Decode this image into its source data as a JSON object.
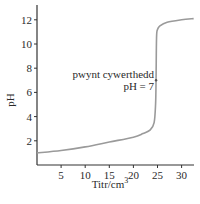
{
  "chart_data": {
    "type": "line",
    "title": "",
    "xlabel": "Titr/cm",
    "xlabel_superscript": "3",
    "ylabel": "pH",
    "xlim": [
      0,
      32.5
    ],
    "ylim": [
      0,
      13
    ],
    "x_ticks": [
      5,
      10,
      15,
      20,
      25,
      30
    ],
    "y_ticks": [
      2,
      4,
      6,
      8,
      10,
      12
    ],
    "grid": false,
    "legend": null,
    "series": [
      {
        "name": "titration curve",
        "color": "#9a9a9a",
        "x": [
          0,
          5,
          10,
          15,
          20,
          22,
          23.5,
          24.3,
          24.6,
          24.7,
          24.8,
          25.0,
          25.5,
          27,
          30,
          32.5
        ],
        "y": [
          1.0,
          1.2,
          1.5,
          1.9,
          2.3,
          2.6,
          2.9,
          3.5,
          5.0,
          7.0,
          10.5,
          11.2,
          11.5,
          11.8,
          12.0,
          12.1
        ]
      }
    ],
    "annotations": [
      {
        "text_line1": "pwynt cywerthedd",
        "text_line2": "pH = 7",
        "x": 24.7,
        "y": 7
      }
    ]
  }
}
